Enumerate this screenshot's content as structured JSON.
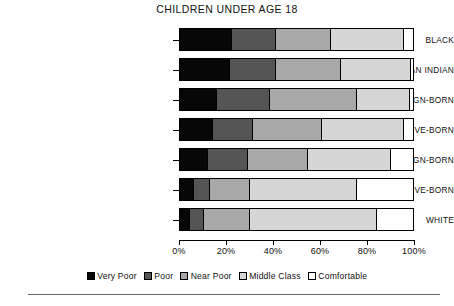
{
  "chart_data": {
    "type": "bar",
    "orientation": "horizontal",
    "stacked": true,
    "normalized_percent": true,
    "title": "CHILDREN UNDER AGE 18",
    "xlabel": "",
    "ylabel": "",
    "xlim": [
      0,
      100
    ],
    "grid": false,
    "legend_position": "bottom",
    "xtick_labels": [
      "0%",
      "20%",
      "40%",
      "60%",
      "80%",
      "100%"
    ],
    "xtick_values": [
      0,
      20,
      40,
      60,
      80,
      100
    ],
    "categories": [
      "BLACK",
      "AMERICAN INDIAN",
      "HISPANIC, FOREIGN-BORN",
      "HISPANIC, NATIVE-BORN",
      "ASIAN, FOREIGN-BORN",
      "ASIAN, NATIVE-BORN",
      "WHITE"
    ],
    "series": [
      {
        "name": "Very Poor",
        "color": "#070707",
        "values": [
          22.5,
          21.5,
          16.0,
          14.0,
          12.0,
          6.0,
          4.5
        ]
      },
      {
        "name": "Poor",
        "color": "#545454",
        "values": [
          18.5,
          19.5,
          22.5,
          17.5,
          17.0,
          7.0,
          6.0
        ]
      },
      {
        "name": "Near Poor",
        "color": "#a8a8a8",
        "values": [
          24.0,
          28.0,
          37.5,
          29.5,
          26.0,
          17.0,
          19.5
        ]
      },
      {
        "name": "Middle Class",
        "color": "#d6d6d6",
        "values": [
          31.0,
          30.0,
          22.5,
          35.0,
          35.5,
          46.0,
          54.5
        ]
      },
      {
        "name": "Comfortable",
        "color": "#ffffff",
        "values": [
          4.0,
          1.0,
          1.5,
          4.0,
          9.5,
          24.0,
          15.5
        ]
      }
    ]
  },
  "title": "CHILDREN UNDER AGE 18",
  "categories": [
    {
      "label": "BLACK"
    },
    {
      "label": "AMERICAN INDIAN"
    },
    {
      "label": "HISPANIC, FOREIGN-BORN"
    },
    {
      "label": "HISPANIC, NATIVE-BORN"
    },
    {
      "label": "ASIAN, FOREIGN-BORN"
    },
    {
      "label": "ASIAN, NATIVE-BORN"
    },
    {
      "label": "WHITE"
    }
  ],
  "xaxis": {
    "ticks": [
      {
        "label": "0%"
      },
      {
        "label": "20%"
      },
      {
        "label": "40%"
      },
      {
        "label": "60%"
      },
      {
        "label": "80%"
      },
      {
        "label": "100%"
      }
    ]
  },
  "legend": {
    "items": [
      {
        "label": "Very Poor",
        "color": "#070707"
      },
      {
        "label": "Poor",
        "color": "#545454"
      },
      {
        "label": "Near Poor",
        "color": "#a8a8a8"
      },
      {
        "label": "Middle Class",
        "color": "#d6d6d6"
      },
      {
        "label": "Comfortable",
        "color": "#ffffff"
      }
    ]
  }
}
